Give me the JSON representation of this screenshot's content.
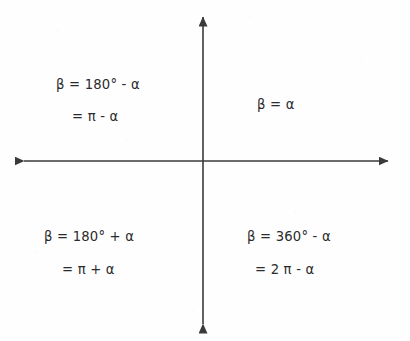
{
  "diagram": {
    "background_color": "#fefefe",
    "ink_color": "#2b2b2b",
    "axes": {
      "origin": {
        "x": 203,
        "y": 161
      },
      "vertical": {
        "x": 203,
        "top_tip_y": 16,
        "bottom_tip_y": 322,
        "arrowheads": "both"
      },
      "horizontal": {
        "y": 161,
        "left_tip_x": 22,
        "right_tip_x": 390,
        "arrowheads": "both"
      },
      "stroke_width": 1.6,
      "stroke_color": "#3a3a3a",
      "arrowhead_style": "solid-triangle"
    },
    "quadrants": {
      "q1_top_right": {
        "name": "Quadrant I",
        "line1": "β = α",
        "line2": ""
      },
      "q2_top_left": {
        "name": "Quadrant II",
        "line1": "β = 180° - α",
        "line2": "= π - α"
      },
      "q3_bottom_left": {
        "name": "Quadrant III",
        "line1": "β = 180° + α",
        "line2": "= π + α"
      },
      "q4_bottom_right": {
        "name": "Quadrant IV",
        "line1": "β = 360° - α",
        "line2": "= 2 π - α"
      }
    }
  }
}
